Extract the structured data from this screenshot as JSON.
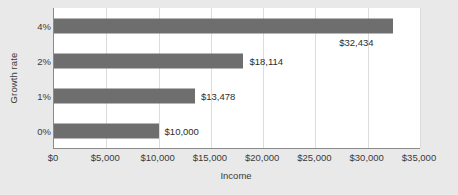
{
  "chart_data": {
    "type": "bar",
    "orientation": "horizontal",
    "title": "",
    "xlabel": "Income",
    "ylabel": "Growth rate",
    "categories": [
      "0%",
      "1%",
      "2%",
      "4%"
    ],
    "values": [
      10000,
      13478,
      18114,
      32434
    ],
    "data_labels": [
      "$10,000",
      "$13,478",
      "$18,114",
      "$32,434"
    ],
    "xlim": [
      0,
      35000
    ],
    "xticks": [
      0,
      5000,
      10000,
      15000,
      20000,
      25000,
      30000,
      35000
    ],
    "xtick_labels": [
      "$0",
      "$5,000",
      "$10,000",
      "$15,000",
      "$20,000",
      "$25,000",
      "$30,000",
      "$35,000"
    ],
    "ytick_labels": [
      "4%",
      "2%",
      "1%",
      "0%"
    ],
    "grid": "vertical",
    "legend": "none",
    "colors": {
      "bar": "#6e6e6e",
      "plot_background": "#ffffff",
      "canvas_background": "#e9e9e9",
      "gridline": "#dcdcdc",
      "axis_line": "#8a8a8a",
      "text": "#3a3a3a"
    }
  }
}
